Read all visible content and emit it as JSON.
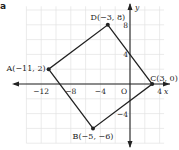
{
  "panel_label": "a",
  "axes": {
    "x_label": "x",
    "y_label": "y",
    "origin_label": "O",
    "x_ticks": [
      {
        "value": -12,
        "label": "−12"
      },
      {
        "value": -8,
        "label": "−8"
      },
      {
        "value": -4,
        "label": "−4"
      },
      {
        "value": 4,
        "label": "4"
      }
    ],
    "y_ticks": [
      {
        "value": 8,
        "label": "8"
      },
      {
        "value": 4,
        "label": "4"
      },
      {
        "value": -4,
        "label": "−4"
      }
    ],
    "grid_step": 2,
    "x_range": [
      -14,
      5
    ],
    "y_range": [
      -8,
      10
    ]
  },
  "points": [
    {
      "name": "A",
      "x": -11,
      "y": 2,
      "label": "A(−11, 2)"
    },
    {
      "name": "B",
      "x": -5,
      "y": -6,
      "label": "B(−5, −6)"
    },
    {
      "name": "C",
      "x": 3,
      "y": 0,
      "label": "C(3, 0)"
    },
    {
      "name": "D",
      "x": -3,
      "y": 8,
      "label": "D(−3, 8)"
    }
  ],
  "polygon": [
    "A",
    "B",
    "C",
    "D"
  ],
  "colors": {
    "grid": "#e2e2e2",
    "axis": "#222222",
    "shape": "#222222"
  }
}
